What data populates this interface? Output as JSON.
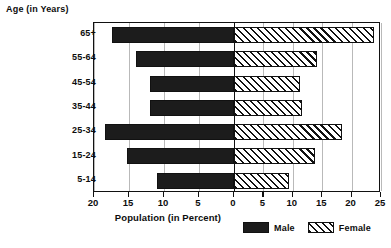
{
  "chart_data": {
    "type": "bar",
    "subtype": "population-pyramid",
    "title": "",
    "ylabel": "Age (in Years)",
    "xlabel": "Population (in Percent)",
    "categories": [
      "65+",
      "55-64",
      "45-54",
      "35-44",
      "25-34",
      "15-24",
      "5-14"
    ],
    "series": [
      {
        "name": "Male",
        "direction": "left",
        "color": "#1c1c1c",
        "pattern": "solid",
        "values": [
          17.5,
          14.0,
          12.0,
          12.0,
          18.5,
          15.3,
          11.0
        ]
      },
      {
        "name": "Female",
        "direction": "right",
        "color": "#ffffff",
        "pattern": "diagonal-hatch",
        "values": [
          23.8,
          14.2,
          11.3,
          11.5,
          18.3,
          13.7,
          9.3
        ]
      }
    ],
    "x_tick_labels": [
      "20",
      "15",
      "10",
      "5",
      "0",
      "5",
      "10",
      "15",
      "20",
      "25"
    ],
    "x_tick_values": [
      -20,
      -15,
      -10,
      -5,
      0,
      5,
      10,
      15,
      20,
      25
    ],
    "xlim_left": 20,
    "xlim_right": 25,
    "grid": true,
    "legend_position": "bottom-right",
    "legend": [
      "Male",
      "Female"
    ]
  },
  "legend": {
    "male_label": "Male",
    "female_label": "Female"
  },
  "axes": {
    "y_title": "Age (in Years)",
    "x_title": "Population (in Percent)"
  }
}
